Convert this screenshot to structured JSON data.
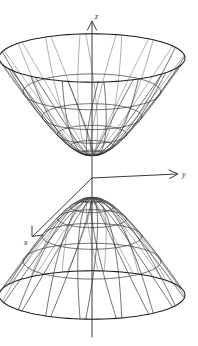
{
  "figure": {
    "background_color": "#ffffff",
    "line_color": "#2b2b2b",
    "axis_color": "#3a3a3a"
  },
  "axes": {
    "vertical": {
      "name": "z-axis",
      "label": "z",
      "direction": "up",
      "arrowhead": true,
      "label_x": 92,
      "label_y": 16
    },
    "horizontal": {
      "name": "y-axis",
      "label": "y",
      "direction": "right",
      "arrowhead": true,
      "label_x": 183,
      "label_y": 174
    },
    "depth": {
      "name": "x-axis",
      "label": "x",
      "direction": "down-left",
      "arrowhead": true,
      "label_x": 26,
      "label_y": 244
    },
    "origin": {
      "x": 92,
      "y": 178
    }
  },
  "chart_data": {
    "type": "surface",
    "surface": "hyperboloid-of-two-sheets",
    "equation": "z^2/c^2 - x^2/a^2 - y^2/b^2 = 1",
    "title": "",
    "xlabel": "x",
    "ylabel": "y",
    "zlabel": "z",
    "grid": true,
    "legend": "none",
    "sheets": [
      {
        "name": "upper-sheet",
        "orientation": "opens-upward",
        "vertex": {
          "x": 92,
          "y": 155
        },
        "rim_y": 58,
        "rim_half_width": 93,
        "rim_half_height": 24
      },
      {
        "name": "lower-sheet",
        "orientation": "opens-downward",
        "vertex": {
          "x": 92,
          "y": 198
        },
        "rim_y": 295,
        "rim_half_width": 93,
        "rim_half_height": 24
      }
    ],
    "mesh": {
      "meridians": 16,
      "parallels": 6
    },
    "projection": {
      "type": "oblique",
      "ellipse_flatten": 0.26,
      "depth_axis_angle_deg": 215
    }
  }
}
